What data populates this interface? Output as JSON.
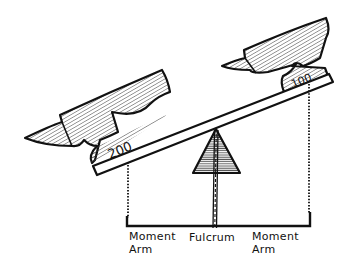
{
  "diagram": {
    "colors": {
      "ink": "#111111",
      "hatch": "#444444",
      "fulcrum_fill": "#888888",
      "beam_fill": "#ffffff",
      "background": "#ffffff"
    },
    "weights": {
      "left": {
        "label": "200",
        "icon": "anvil-icon"
      },
      "right": {
        "label": "100",
        "icon": "anvil-icon"
      }
    },
    "labels": {
      "left_arm_line1": "Moment",
      "left_arm_line2": "Arm",
      "fulcrum": "Fulcrum",
      "right_arm_line1": "Moment",
      "right_arm_line2": "Arm"
    }
  }
}
